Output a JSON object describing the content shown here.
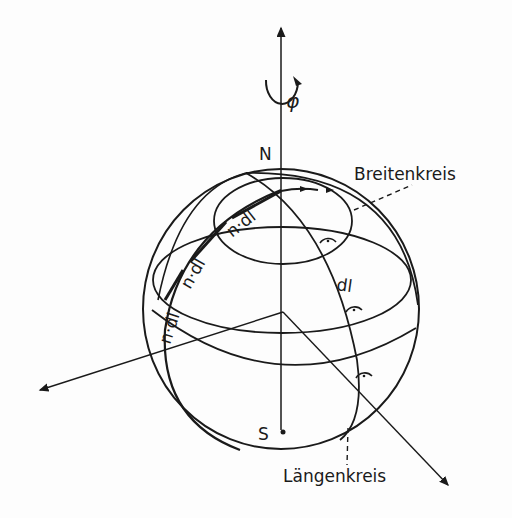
{
  "figure": {
    "type": "sphere-coordinate-diagram",
    "labels": {
      "north_pole": "N",
      "south_pole": "S",
      "rotation_symbol": "φ",
      "latitude_circle": "Breitenkreis",
      "longitude_circle": "Längenkreis",
      "element_longitude": "dl",
      "element_latitude_1": "n·dl",
      "element_latitude_2": "n·dl",
      "element_latitude_3": "n·dl"
    },
    "colors": {
      "ink": "#1a1a1a",
      "paper": "#fdfdfd"
    }
  }
}
